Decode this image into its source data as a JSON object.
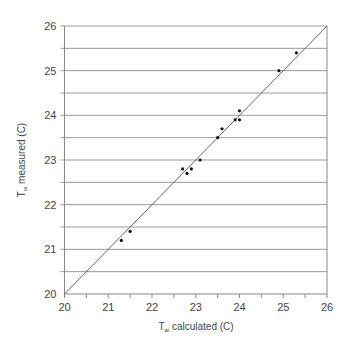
{
  "chart_data": {
    "type": "scatter",
    "title": "",
    "xlabel": "T_ai calculated (C)",
    "xlabel_parts": {
      "main": "T",
      "sub": "ai",
      "rest": " calculated (C)"
    },
    "ylabel": "T_w measured (C)",
    "ylabel_parts": {
      "main": "T",
      "sub": "w",
      "rest": " measured (C)"
    },
    "xlim": [
      20,
      26
    ],
    "ylim": [
      20,
      26
    ],
    "x_ticks": [
      20,
      21,
      22,
      23,
      24,
      25,
      26
    ],
    "y_ticks": [
      20,
      21,
      22,
      23,
      24,
      25,
      26
    ],
    "x_minor_step": 0.5,
    "grid": {
      "horizontal": true,
      "vertical": false,
      "step": 0.5
    },
    "legend": null,
    "reference_line": {
      "label": "y = x",
      "from": [
        20,
        20
      ],
      "to": [
        26,
        26
      ]
    },
    "series": [
      {
        "name": "measurements",
        "marker": "dot",
        "color": "#111111",
        "points": [
          {
            "x": 21.3,
            "y": 21.2
          },
          {
            "x": 21.5,
            "y": 21.4
          },
          {
            "x": 22.7,
            "y": 22.8
          },
          {
            "x": 22.8,
            "y": 22.7
          },
          {
            "x": 22.9,
            "y": 22.8
          },
          {
            "x": 23.1,
            "y": 23.0
          },
          {
            "x": 23.5,
            "y": 23.5
          },
          {
            "x": 23.6,
            "y": 23.7
          },
          {
            "x": 23.9,
            "y": 23.9
          },
          {
            "x": 24.0,
            "y": 23.9
          },
          {
            "x": 24.0,
            "y": 24.1
          },
          {
            "x": 24.9,
            "y": 25.0
          },
          {
            "x": 25.3,
            "y": 25.4
          }
        ]
      }
    ]
  },
  "colors": {
    "axis": "#888888",
    "grid": "#9a9a9a",
    "reference_line": "#555555",
    "points": "#111111"
  }
}
